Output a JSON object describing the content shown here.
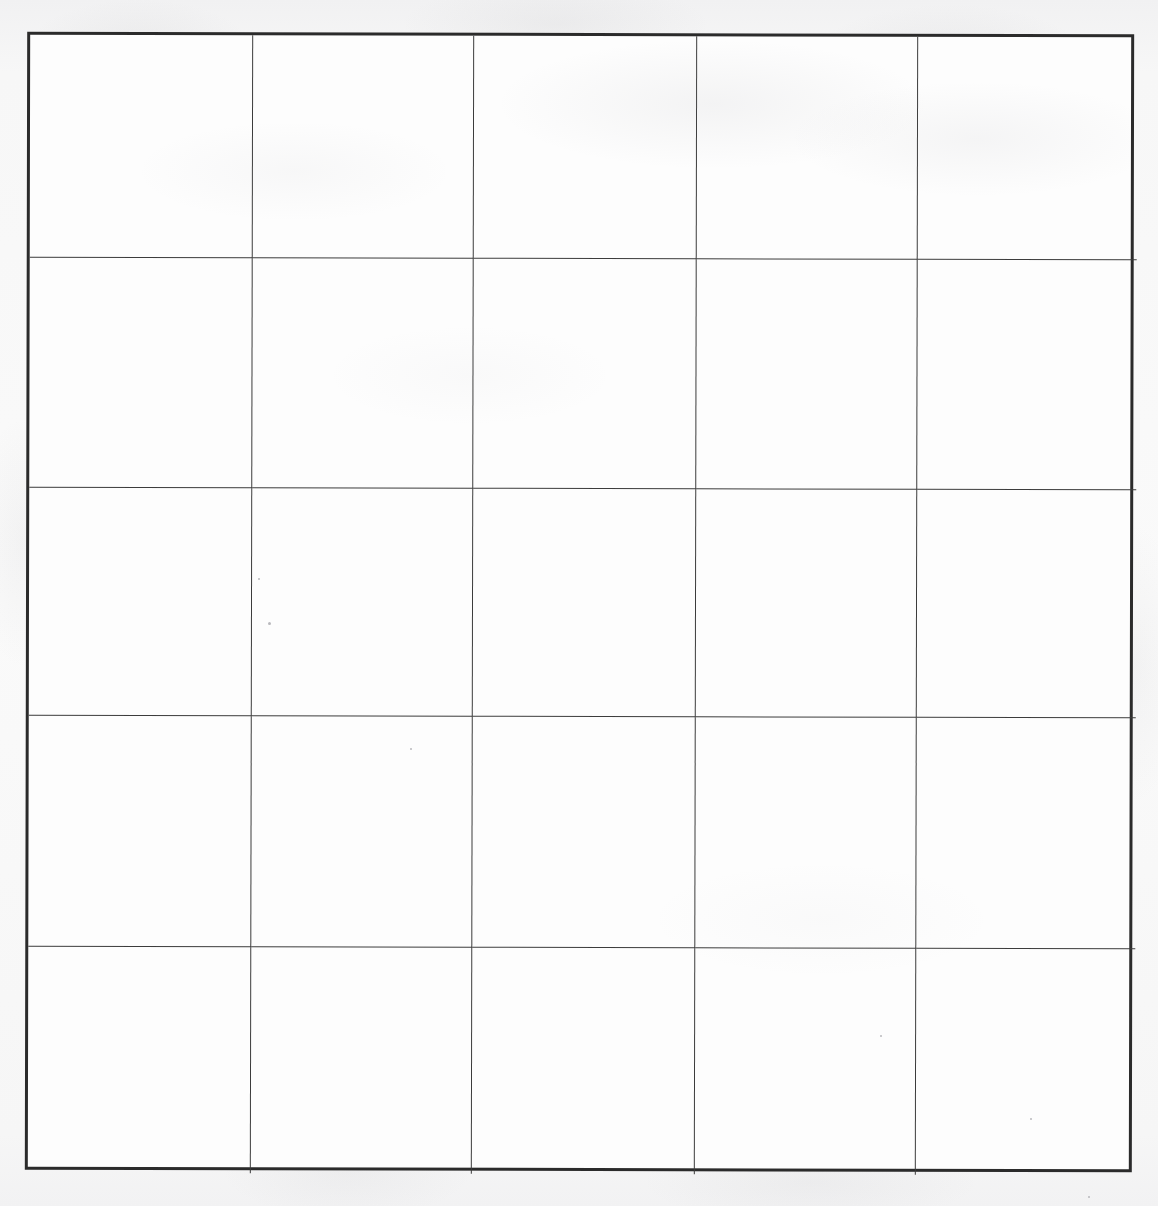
{
  "document": {
    "kind": "scanned-blank-grid-table",
    "title": "",
    "page_width": 1158,
    "page_height": 1206,
    "background_color": "#f6f6f6",
    "paper_color": "#fdfdfd"
  },
  "table": {
    "name": "blank-grid",
    "rows": 5,
    "columns": 5,
    "total_cells": 25,
    "has_header_row": false,
    "has_header_column": false,
    "is_empty": true,
    "outer_border_color": "#2b2b2b",
    "outer_border_width_px": 3,
    "gridline_color": "#3c3c3c",
    "gridline_width_px": 1.6,
    "bounds": {
      "left": 26,
      "top": 33,
      "right": 1133,
      "bottom": 1171
    },
    "column_divider_x": [
      249,
      470,
      693,
      914
    ],
    "row_divider_y": [
      256,
      486,
      714,
      945
    ],
    "column_headers": [
      "",
      "",
      "",
      "",
      ""
    ],
    "cells": [
      [
        "",
        "",
        "",
        "",
        ""
      ],
      [
        "",
        "",
        "",
        "",
        ""
      ],
      [
        "",
        "",
        "",
        "",
        ""
      ],
      [
        "",
        "",
        "",
        "",
        ""
      ],
      [
        "",
        "",
        "",
        "",
        ""
      ]
    ]
  },
  "artifacts": {
    "description": "scanner speckle and paper texture",
    "specks": [
      {
        "x": 268,
        "y": 622,
        "size": 3
      },
      {
        "x": 258,
        "y": 578,
        "size": 2
      },
      {
        "x": 880,
        "y": 1035,
        "size": 2
      },
      {
        "x": 1030,
        "y": 1118,
        "size": 2
      },
      {
        "x": 410,
        "y": 748,
        "size": 2
      },
      {
        "x": 1088,
        "y": 1196,
        "size": 2
      }
    ]
  }
}
